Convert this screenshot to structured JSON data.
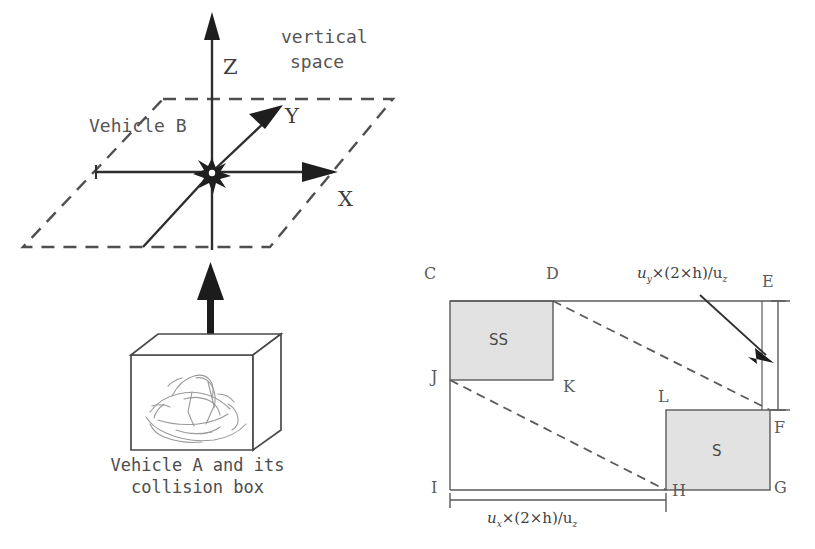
{
  "figure": {
    "left_panel": {
      "title_text": "vertical\nspace",
      "vertical_space_line1": "vertical",
      "vertical_space_line2": "space",
      "axis_z": "Z",
      "axis_y": "Y",
      "axis_x": "X",
      "vehicle_b_label": "Vehicle B",
      "caption_line1": "Vehicle A and its",
      "caption_line2": "collision box",
      "origin_marker": "collision-star-burst",
      "plane_style": "dashed-parallelogram",
      "box_label": "vehicle-a-collision-box"
    },
    "right_panel": {
      "nodes": [
        {
          "id": "C",
          "label": "C",
          "x": 424,
          "y": 268
        },
        {
          "id": "D",
          "label": "D",
          "x": 546,
          "y": 268
        },
        {
          "id": "E",
          "label": "E",
          "x": 762,
          "y": 274
        },
        {
          "id": "J",
          "label": "J",
          "x": 431,
          "y": 371
        },
        {
          "id": "K",
          "label": "K",
          "x": 563,
          "y": 381
        },
        {
          "id": "L",
          "label": "L",
          "x": 658,
          "y": 391
        },
        {
          "id": "F",
          "label": "F",
          "x": 774,
          "y": 422
        },
        {
          "id": "I",
          "label": "I",
          "x": 431,
          "y": 482
        },
        {
          "id": "H",
          "label": "H",
          "x": 670,
          "y": 485
        },
        {
          "id": "G",
          "label": "G",
          "x": 774,
          "y": 482
        }
      ],
      "regions": [
        {
          "name": "SS",
          "label": "SS",
          "fill": "#e2e2e2"
        },
        {
          "name": "S",
          "label": "S",
          "fill": "#e2e2e2"
        }
      ],
      "dimension_vertical": {
        "label_prefix": "u",
        "label_sub": "y",
        "label_rest": "×(2×h)/u",
        "label_sub2": "z",
        "full": "u_y×(2×h)/u_z"
      },
      "dimension_horizontal": {
        "label_prefix": "u",
        "label_sub": "x",
        "label_rest": "×(2×h)/u",
        "label_sub2": "z",
        "full": "u_x×(2×h)/u_z"
      }
    },
    "colors": {
      "stroke": "#4f4f4f",
      "dashed": "#5a5a5a",
      "shade_fill": "#e2e2e2",
      "text": "#4a4a4a",
      "background": "#ffffff"
    }
  }
}
